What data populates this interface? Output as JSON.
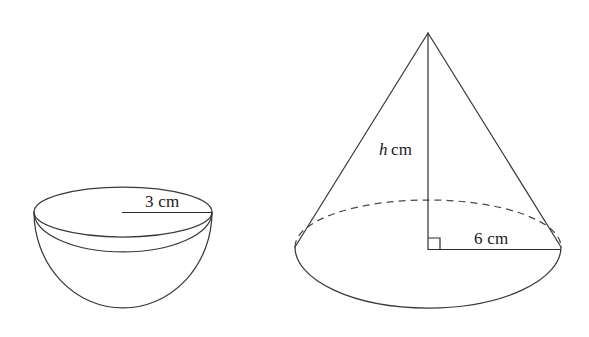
{
  "page": {
    "background_color": "#ffffff",
    "ink_color": "#3a3a3a",
    "width": 589,
    "height": 337
  },
  "figures": [
    {
      "id": "hemisphere-bowl",
      "name": "bowl",
      "shape": "hemisphere",
      "dimension_label": "3 cm",
      "dimension_kind": "radius",
      "dimension_value": 3,
      "dimension_units": "cm"
    },
    {
      "id": "cone",
      "name": "cone",
      "shape": "cone",
      "height_label_var": "h",
      "height_label_units": "cm",
      "radius_label": "6 cm",
      "radius_value": 6,
      "radius_units": "cm",
      "right_angle_marked": true,
      "hidden_edge_style": "dashed"
    }
  ],
  "labels": {
    "bowl_radius": "3 cm",
    "cone_height_var": "h",
    "cone_height_units": "cm",
    "cone_radius": "6 cm"
  }
}
